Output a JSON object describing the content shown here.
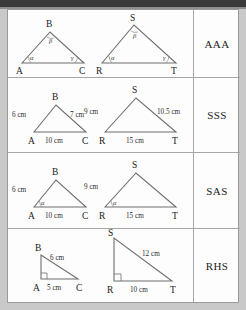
{
  "document": {
    "title": "Triangle Congruence / Similarity Criteria Table",
    "columns": [
      "diagrams",
      "rule"
    ],
    "ink_color": "#6f6f6f",
    "text_color": "#1a1a1a",
    "paper_color": "#fdfdfd",
    "border_color": "#a6a6a6"
  },
  "rows": [
    {
      "rule": "AAA",
      "triangles": [
        {
          "name": "ABC",
          "vertices": [
            "A",
            "B",
            "C"
          ],
          "angle_marks": [
            {
              "at": "A",
              "label": "α"
            },
            {
              "at": "B",
              "label": "β"
            },
            {
              "at": "C",
              "label": "γ"
            }
          ],
          "side_labels": []
        },
        {
          "name": "RST",
          "vertices": [
            "R",
            "S",
            "T"
          ],
          "angle_marks": [
            {
              "at": "R",
              "label": "α"
            },
            {
              "at": "S",
              "label": "β"
            },
            {
              "at": "T",
              "label": "γ"
            }
          ],
          "side_labels": []
        }
      ]
    },
    {
      "rule": "SSS",
      "triangles": [
        {
          "name": "ABC",
          "vertices": [
            "A",
            "B",
            "C"
          ],
          "angle_marks": [],
          "side_labels": [
            {
              "side": "AB",
              "text": "6 cm"
            },
            {
              "side": "BC",
              "text": "7 cm"
            },
            {
              "side": "AC",
              "text": "10 cm"
            }
          ]
        },
        {
          "name": "RST",
          "vertices": [
            "R",
            "S",
            "T"
          ],
          "angle_marks": [],
          "side_labels": [
            {
              "side": "RS",
              "text": "9 cm"
            },
            {
              "side": "ST",
              "text": "10.5 cm"
            },
            {
              "side": "RT",
              "text": "15 cm"
            }
          ]
        }
      ]
    },
    {
      "rule": "SAS",
      "triangles": [
        {
          "name": "ABC",
          "vertices": [
            "A",
            "B",
            "C"
          ],
          "angle_marks": [
            {
              "at": "A",
              "label": "α"
            }
          ],
          "side_labels": [
            {
              "side": "AB",
              "text": "6 cm"
            },
            {
              "side": "AC",
              "text": "10 cm"
            }
          ]
        },
        {
          "name": "RST",
          "vertices": [
            "R",
            "S",
            "T"
          ],
          "angle_marks": [
            {
              "at": "R",
              "label": "α"
            }
          ],
          "side_labels": [
            {
              "side": "RS",
              "text": "9 cm"
            },
            {
              "side": "RT",
              "text": "15 cm"
            }
          ]
        }
      ]
    },
    {
      "rule": "RHS",
      "triangles": [
        {
          "name": "ABC",
          "vertices": [
            "A",
            "B",
            "C"
          ],
          "angle_marks": [
            {
              "at": "A",
              "label": "right-angle"
            }
          ],
          "side_labels": [
            {
              "side": "BC",
              "text": "6 cm"
            },
            {
              "side": "AC",
              "text": "5 cm"
            }
          ]
        },
        {
          "name": "RST",
          "vertices": [
            "R",
            "S",
            "T"
          ],
          "angle_marks": [
            {
              "at": "R",
              "label": "right-angle"
            }
          ],
          "side_labels": [
            {
              "side": "ST",
              "text": "12 cm"
            },
            {
              "side": "RT",
              "text": "10 cm"
            }
          ]
        }
      ]
    }
  ]
}
